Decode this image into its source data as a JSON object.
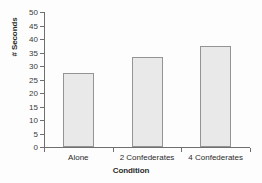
{
  "chart_data": {
    "type": "bar",
    "title": "",
    "subtitle": "",
    "categories": [
      "Alone",
      "2 Confederates",
      "4 Confederates"
    ],
    "values": [
      27.5,
      33.5,
      37.5
    ],
    "xlabel": "Condition",
    "ylabel": "# Seconds",
    "ylim": [
      0,
      50
    ],
    "yticks": [
      0,
      5,
      10,
      15,
      20,
      25,
      30,
      35,
      40,
      45,
      50
    ],
    "ytick_labels": [
      "0",
      "5",
      "10",
      "15",
      "20",
      "25",
      "30",
      "35",
      "40",
      "45",
      "50"
    ],
    "grid": false,
    "legend": null,
    "legend_position": "none",
    "annotations": [],
    "colors": {
      "bar_fill": "#e9e9e9",
      "bar_edge": "#949494",
      "axis": "#6f6f6f",
      "text": "#2b2b2b",
      "background": "#fdfdfd"
    }
  }
}
